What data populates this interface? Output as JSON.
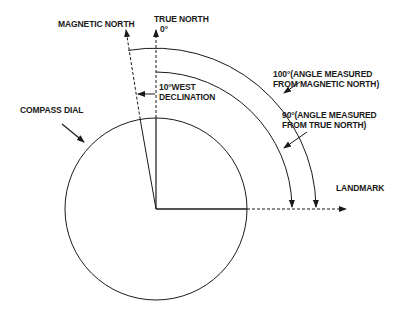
{
  "diagram": {
    "labels": {
      "magnetic_north": "MAGNETIC NORTH",
      "true_north": "TRUE NORTH",
      "true_north_deg": "0°",
      "declination_line1": "10°WEST",
      "declination_line2": "DECLINATION",
      "compass_dial": "COMPASS DIAL",
      "angle_magnetic_line1": "100°(ANGLE MEASURED",
      "angle_magnetic_line2": "FROM MAGNETIC NORTH)",
      "angle_true_line1": "90°(ANGLE MEASURED",
      "angle_true_line2": "FROM TRUE NORTH)",
      "landmark": "LANDMARK"
    },
    "values": {
      "declination_deg": 10,
      "declination_direction": "West",
      "angle_from_magnetic_north_deg": 100,
      "angle_from_true_north_deg": 90
    },
    "colors": {
      "line": "#1a1a1a",
      "background": "#ffffff"
    }
  }
}
